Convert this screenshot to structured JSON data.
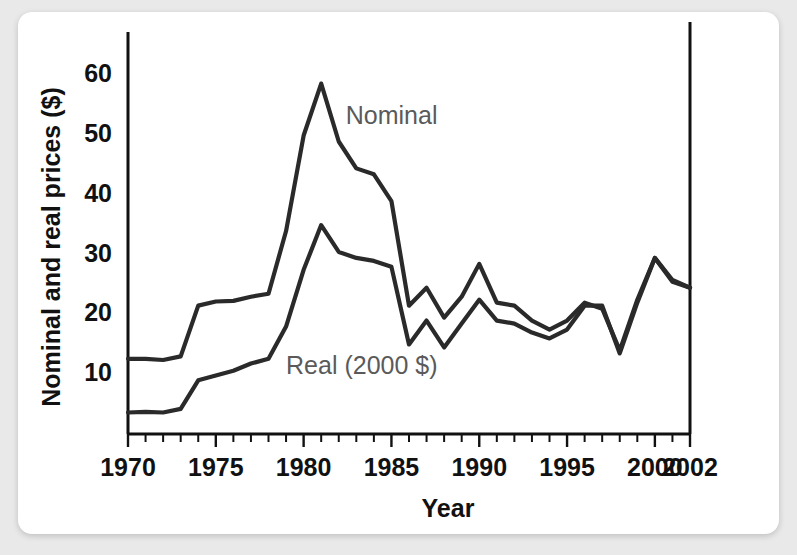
{
  "chart_data": {
    "type": "line",
    "title": "",
    "xlabel": "Year",
    "ylabel": "Nominal and real prices ($)",
    "xlim": [
      1970,
      2002
    ],
    "ylim": [
      0,
      65
    ],
    "grid": false,
    "legend_position": "inline-annotation",
    "y_ticks": [
      10,
      20,
      30,
      40,
      50,
      60
    ],
    "y_tick_labels": [
      "10",
      "20",
      "30",
      "40",
      "50",
      "60"
    ],
    "x_ticks": [
      1970,
      1975,
      1980,
      1985,
      1990,
      1995,
      2000,
      2002
    ],
    "x_tick_labels": [
      "1970",
      "1975",
      "1980",
      "1985",
      "1990",
      "1995",
      "2000",
      "2002"
    ],
    "x_minor_tick_step": 1,
    "x": [
      1970,
      1971,
      1972,
      1973,
      1974,
      1975,
      1976,
      1977,
      1978,
      1979,
      1980,
      1981,
      1982,
      1983,
      1984,
      1985,
      1986,
      1987,
      1988,
      1989,
      1990,
      1991,
      1992,
      1993,
      1994,
      1995,
      1996,
      1997,
      1998,
      1999,
      2000,
      2001,
      2002
    ],
    "series": [
      {
        "name": "Nominal",
        "label": "Nominal",
        "color": "#2a2a2a",
        "values": [
          12.6,
          12.6,
          12.4,
          13.0,
          21.5,
          22.2,
          22.3,
          23.0,
          23.5,
          34.0,
          50.0,
          58.7,
          49.0,
          44.5,
          43.5,
          39.0,
          21.5,
          24.5,
          19.5,
          23.0,
          28.5,
          22.0,
          21.5,
          19.0,
          17.5,
          19.0,
          22.0,
          21.0,
          14.0,
          22.5,
          29.5,
          25.5,
          24.5
        ]
      },
      {
        "name": "Real (2000 $)",
        "label": "Real (2000 $)",
        "color": "#2a2a2a",
        "values": [
          3.6,
          3.7,
          3.6,
          4.2,
          9.0,
          9.8,
          10.6,
          11.8,
          12.6,
          18.0,
          27.5,
          35.0,
          30.5,
          29.5,
          29.0,
          28.0,
          15.0,
          19.0,
          14.5,
          18.5,
          22.5,
          19.0,
          18.5,
          17.0,
          16.0,
          17.5,
          21.5,
          21.5,
          13.5,
          22.0,
          29.5,
          25.8,
          24.5
        ]
      }
    ],
    "annotations": [
      {
        "text": "Nominal",
        "x": 1982.4,
        "y": 52.0
      },
      {
        "text": "Real (2000 $)",
        "x": 1979.0,
        "y": 10.0
      }
    ]
  }
}
